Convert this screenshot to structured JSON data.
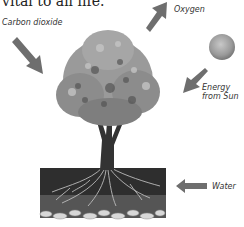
{
  "caption": "vital to all life.",
  "labels": {
    "carbon_dioxide": "Carbon dioxide",
    "oxygen": "Oxygen",
    "energy_line1": "Energy",
    "energy_line2": "from Sun",
    "water": "Water"
  },
  "colors": {
    "arrow": "#6e6e6e",
    "sun": "#9a9a9a",
    "soil": "#2a2a2a",
    "foliage": "#8a8a8a"
  }
}
